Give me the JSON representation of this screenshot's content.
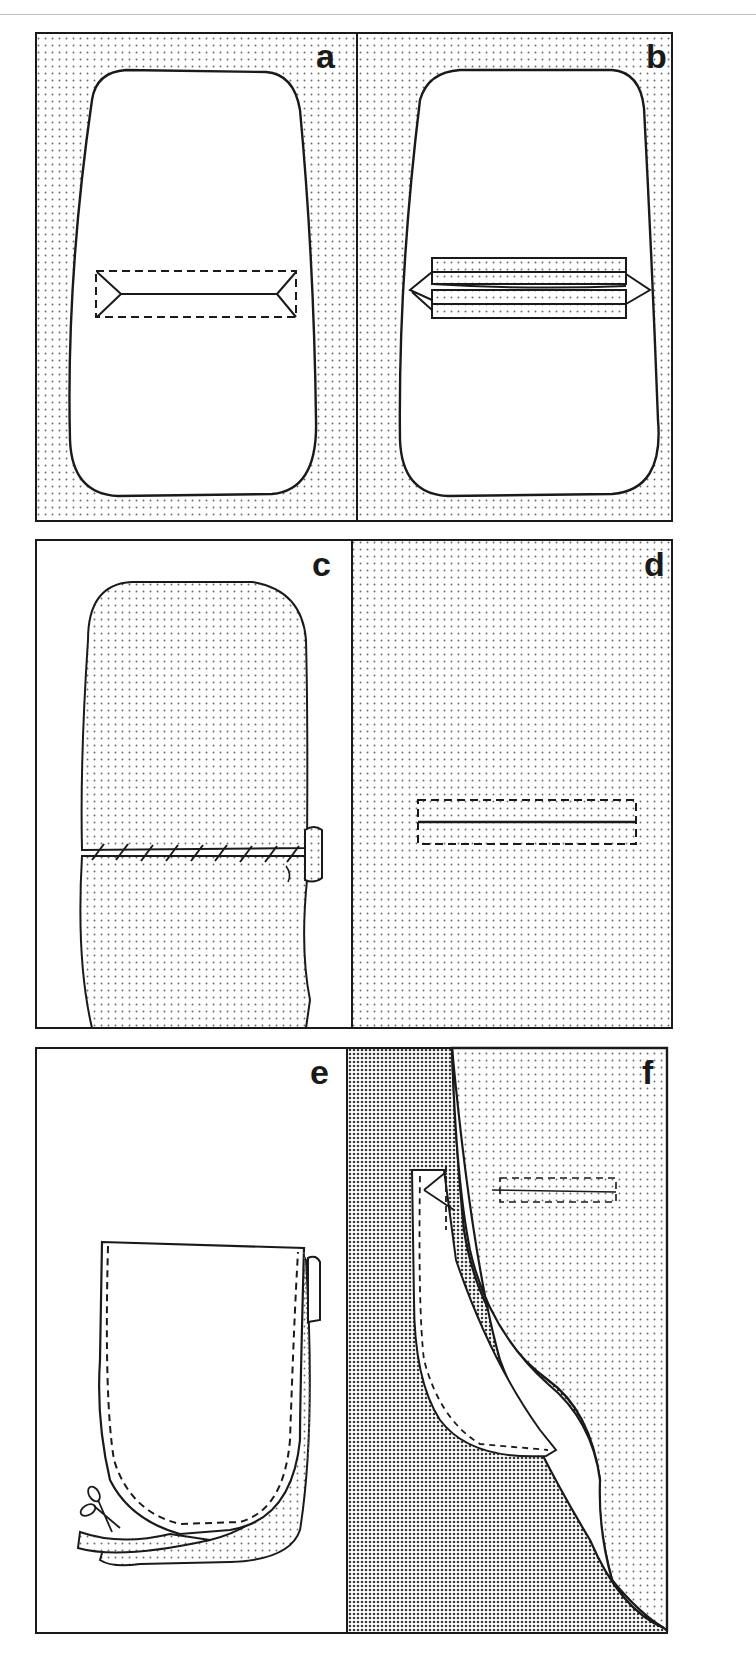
{
  "figure": {
    "panels": [
      {
        "id": "a",
        "label": "a",
        "description": "Pocket piece placed right side down on fabric; stitching box with slash and corner cuts marked"
      },
      {
        "id": "b",
        "label": "b",
        "description": "Pocket turned through slash; welt folds formed with triangles at ends"
      },
      {
        "id": "c",
        "label": "c",
        "description": "Welt edges whipstitched together on the wrong side"
      },
      {
        "id": "d",
        "label": "d",
        "description": "Finished welt opening seen from right side, stitched box"
      },
      {
        "id": "e",
        "label": "e",
        "description": "Pocket bag stitched around; excess trimmed with scissors"
      },
      {
        "id": "f",
        "label": "f",
        "description": "Garment front folded back to stitch triangle and pocket bag"
      }
    ]
  },
  "colors": {
    "ink": "#1a1a1a",
    "light_dot": "#6a6a6a",
    "dark_dot": "#2a2a2a",
    "paper": "#ffffff"
  }
}
